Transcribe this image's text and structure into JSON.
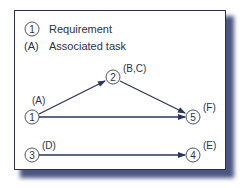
{
  "legend": {
    "requirement_symbol": "1",
    "requirement_label": "Requirement",
    "task_symbol": "(A)",
    "task_label": "Associated task"
  },
  "nodes": [
    {
      "id": "1",
      "task": "(A)"
    },
    {
      "id": "2",
      "task": "(B,C)"
    },
    {
      "id": "5",
      "task": "(F)"
    },
    {
      "id": "3",
      "task": "(D)"
    },
    {
      "id": "4",
      "task": "(E)"
    }
  ],
  "edges": [
    {
      "from": "1",
      "to": "2"
    },
    {
      "from": "2",
      "to": "5"
    },
    {
      "from": "1",
      "to": "5"
    },
    {
      "from": "3",
      "to": "4"
    }
  ],
  "colors": {
    "arrow": "#2a3560",
    "shadow": "#4a5680",
    "text": "#2c3145"
  }
}
